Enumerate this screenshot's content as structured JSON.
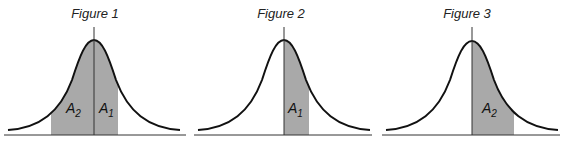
{
  "figures": [
    {
      "title": "Figure 1",
      "shaded_regions": [
        {
          "label": "A",
          "subscript": "2",
          "side": "left-of-mean",
          "color": "#a9a9a9"
        },
        {
          "label": "A",
          "subscript": "1",
          "side": "right-of-mean",
          "color": "#a9a9a9"
        }
      ]
    },
    {
      "title": "Figure 2",
      "shaded_regions": [
        {
          "label": "A",
          "subscript": "1",
          "side": "right-of-mean",
          "color": "#a9a9a9"
        }
      ]
    },
    {
      "title": "Figure 3",
      "shaded_regions": [
        {
          "label": "A",
          "subscript": "2",
          "side": "right-of-mean",
          "color": "#a9a9a9"
        }
      ]
    }
  ],
  "colors": {
    "curve": "#111111",
    "shade": "#a9a9a9",
    "axis": "#333333"
  }
}
